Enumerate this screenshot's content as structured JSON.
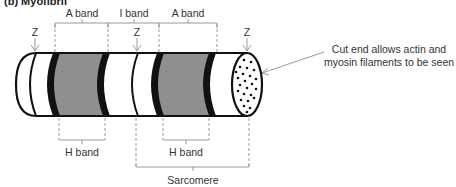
{
  "title": "(b) Myofibril",
  "labels": {
    "top_bands": [
      {
        "text": "A band",
        "x": 82
      },
      {
        "text": "I band",
        "x": 134
      },
      {
        "text": "A band",
        "x": 188
      }
    ],
    "z_lines": [
      {
        "text": "Z",
        "x": 35
      },
      {
        "text": "Z",
        "x": 137
      },
      {
        "text": "Z",
        "x": 247
      }
    ],
    "h_bands": [
      {
        "text": "H band",
        "x": 82
      },
      {
        "text": "H band",
        "x": 186
      }
    ],
    "sarcomere": "Sarcomere",
    "cut_end_note": "Cut end allows actin and myosin filaments to be seen"
  },
  "colors": {
    "outline": "#111111",
    "a_band_fill": "#8f8f8f",
    "bracket": "#9a9a9a",
    "text": "#333333"
  }
}
